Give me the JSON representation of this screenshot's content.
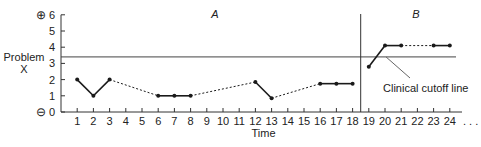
{
  "chart_data": {
    "type": "line",
    "title": "",
    "xlabel": "Time",
    "ylabel": "Problem X",
    "ylim": [
      0,
      6
    ],
    "xlim": [
      0,
      24
    ],
    "y_ticks": [
      "0",
      "1",
      "2",
      "3",
      "4",
      "5",
      "6"
    ],
    "y_top_symbol": "⊕",
    "y_bottom_symbol": "⊖",
    "x_ticks": [
      "1",
      "2",
      "3",
      "4",
      "5",
      "6",
      "7",
      "8",
      "9",
      "10",
      "11",
      "12",
      "13",
      "14",
      "15",
      "16",
      "17",
      "18",
      "19",
      "20",
      "21",
      "22",
      "23",
      "24"
    ],
    "x_continuation": ". . .",
    "grid": false,
    "phases": [
      {
        "label": "A",
        "x_start": 0,
        "x_end": 18.5
      },
      {
        "label": "B",
        "x_start": 18.5,
        "x_end": 24
      }
    ],
    "phase_change_x": 18.5,
    "cutoff": {
      "y": 3.4,
      "label": "Clinical cutoff line"
    },
    "series": [
      {
        "name": "Problem X",
        "points": [
          {
            "x": 1,
            "y": 2
          },
          {
            "x": 2,
            "y": 1
          },
          {
            "x": 3,
            "y": 2
          },
          {
            "x": 6,
            "y": 1
          },
          {
            "x": 7,
            "y": 1
          },
          {
            "x": 8,
            "y": 1
          },
          {
            "x": 12,
            "y": 1.85
          },
          {
            "x": 13,
            "y": 0.85
          },
          {
            "x": 16,
            "y": 1.75
          },
          {
            "x": 17,
            "y": 1.75
          },
          {
            "x": 18,
            "y": 1.75
          },
          {
            "x": 19,
            "y": 2.8
          },
          {
            "x": 20,
            "y": 4.1
          },
          {
            "x": 21,
            "y": 4.1
          },
          {
            "x": 23,
            "y": 4.1
          },
          {
            "x": 24,
            "y": 4.1
          }
        ],
        "solid_segments": [
          [
            1,
            2
          ],
          [
            2,
            3
          ],
          [
            6,
            7
          ],
          [
            7,
            8
          ],
          [
            12,
            13
          ],
          [
            16,
            17
          ],
          [
            17,
            18
          ],
          [
            19,
            20
          ],
          [
            20,
            21
          ],
          [
            23,
            24
          ]
        ],
        "dotted_segments": [
          [
            3,
            6
          ],
          [
            8,
            12
          ],
          [
            13,
            16
          ],
          [
            21,
            23
          ]
        ]
      }
    ]
  },
  "colors": {
    "line": "#1a1a1a",
    "axis": "#333333",
    "cutoff": "#444444",
    "callout": "#666666"
  }
}
